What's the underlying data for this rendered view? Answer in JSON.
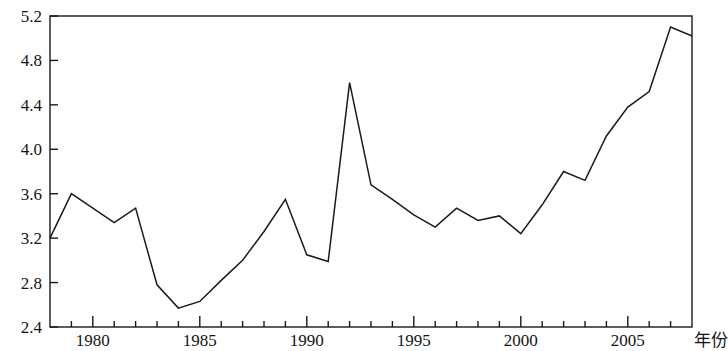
{
  "chart_data": {
    "type": "line",
    "title": "",
    "subtitle": "",
    "xlabel": "年份",
    "ylabel": "",
    "grid": false,
    "legend": "none",
    "xlim": [
      1978,
      2008
    ],
    "ylim": [
      2.4,
      5.2
    ],
    "x_major_ticks": [
      1980,
      1985,
      1990,
      1995,
      2000,
      2005
    ],
    "x_minor_tick_interval": 1,
    "y_ticks": [
      2.4,
      2.8,
      3.2,
      3.6,
      4.0,
      4.4,
      4.8,
      5.2
    ],
    "y_tick_labels": [
      "2.4",
      "2.8",
      "3.2",
      "3.6",
      "4.0",
      "4.4",
      "4.8",
      "5.2"
    ],
    "x_tick_labels": [
      "1980",
      "1985",
      "1990",
      "1995",
      "2000",
      "2005"
    ],
    "x": [
      1978,
      1979,
      1980,
      1981,
      1982,
      1983,
      1984,
      1985,
      1986,
      1987,
      1988,
      1989,
      1990,
      1991,
      1992,
      1993,
      1994,
      1995,
      1996,
      1997,
      1998,
      1999,
      2000,
      2001,
      2002,
      2003,
      2004,
      2005,
      2006,
      2007,
      2008
    ],
    "values": [
      3.2,
      3.6,
      3.47,
      3.34,
      3.47,
      2.78,
      2.57,
      2.63,
      2.82,
      3.0,
      3.26,
      3.55,
      3.05,
      2.99,
      4.6,
      3.68,
      3.55,
      3.41,
      3.3,
      3.47,
      3.36,
      3.4,
      3.24,
      3.5,
      3.8,
      3.72,
      4.12,
      4.38,
      4.52,
      5.1,
      5.02
    ],
    "line_color": "#1a1a1a",
    "axis_color": "#1a1a1a",
    "background_color": "#ffffff"
  }
}
